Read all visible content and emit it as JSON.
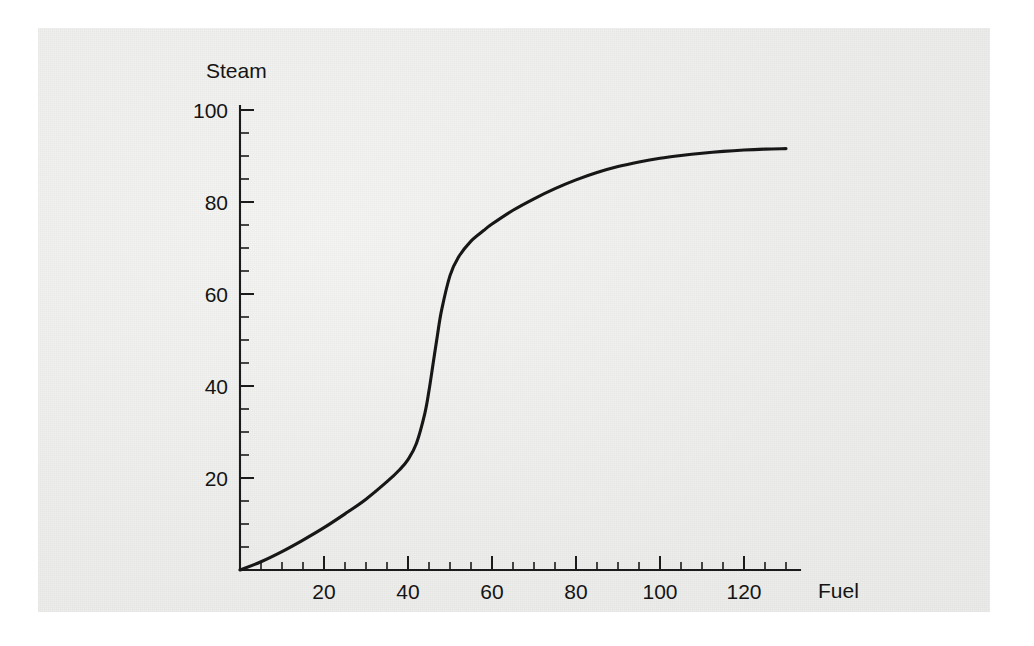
{
  "chart_data": {
    "type": "line",
    "title": "",
    "subtitle": "",
    "xlabel": "Fuel",
    "ylabel": "Steam",
    "xlim": [
      0,
      131
    ],
    "ylim": [
      0,
      104
    ],
    "grid": false,
    "legend": null,
    "x_ticks": [
      20,
      40,
      60,
      80,
      100,
      120
    ],
    "x_tick_labels": [
      "20",
      "40",
      "60",
      "80",
      "100",
      "120"
    ],
    "x_minor_step": 5,
    "y_ticks": [
      20,
      40,
      60,
      80,
      100
    ],
    "y_tick_labels": [
      "20",
      "40",
      "60",
      "80",
      "100"
    ],
    "y_minor_step": 5,
    "series": [
      {
        "name": "Steam vs Fuel",
        "color": "#171717",
        "x": [
          0,
          5,
          10,
          15,
          20,
          25,
          30,
          35,
          38,
          40,
          42,
          44,
          45,
          46,
          47,
          48,
          50,
          52,
          55,
          58,
          60,
          65,
          70,
          75,
          80,
          85,
          90,
          95,
          100,
          105,
          110,
          115,
          120,
          125,
          130
        ],
        "y": [
          0,
          1.8,
          4.0,
          6.5,
          9.2,
          12.2,
          15.4,
          19.2,
          21.8,
          24.0,
          27.5,
          34.0,
          39.0,
          45.0,
          51.0,
          56.5,
          64.0,
          68.0,
          71.5,
          73.8,
          75.2,
          78.2,
          80.7,
          82.9,
          84.8,
          86.4,
          87.7,
          88.7,
          89.5,
          90.1,
          90.6,
          91.0,
          91.3,
          91.5,
          91.6
        ]
      }
    ]
  },
  "labels": {
    "y_axis_title": "Steam",
    "x_axis_title": "Fuel",
    "y_100": "100",
    "y_80": "80",
    "y_60": "60",
    "y_40": "40",
    "y_20": "20",
    "x_20": "20",
    "x_40": "40",
    "x_60": "60",
    "x_80": "80",
    "x_100": "100",
    "x_120": "120"
  },
  "colors": {
    "curve": "#171717",
    "axis": "#1b1b1b",
    "text": "#141414",
    "paper": "#f2f2f0",
    "page": "#ffffff"
  }
}
